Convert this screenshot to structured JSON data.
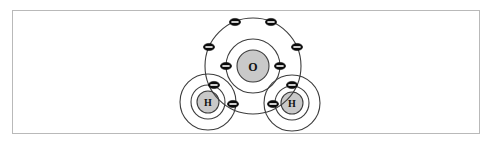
{
  "figure": {
    "molecule_formula": "H2O",
    "background_color": "#ffffff",
    "border_color": "#b9b9b9",
    "shell_color": "#3d3d3d",
    "nucleus_fill": "#c9c9c9",
    "electron_color": "#0b0b0b",
    "electron_sign_color": "#ffffff"
  },
  "atoms": {
    "oxygen": {
      "symbol": "O",
      "cx": 253,
      "cy": 66,
      "nucleus_r": 16,
      "inner_shell_r": 27,
      "outer_shell_r": 48,
      "inner_electron_count": 2,
      "outer_electron_count": 6
    },
    "hydrogen_left": {
      "symbol": "H",
      "cx": 208,
      "cy": 102,
      "nucleus_r": 11,
      "inner_shell_r": 17,
      "outer_shell_r": 28,
      "electron_count": 1
    },
    "hydrogen_right": {
      "symbol": "H",
      "cx": 292,
      "cy": 103,
      "nucleus_r": 11,
      "inner_shell_r": 17,
      "outer_shell_r": 28,
      "electron_count": 1
    }
  },
  "electrons": {
    "symbol": "-",
    "rx": 5.6,
    "ry": 3.6,
    "oxygen_inner": [
      {
        "x": 226,
        "y": 66
      },
      {
        "x": 280,
        "y": 66
      }
    ],
    "oxygen_outer": [
      {
        "x": 235,
        "y": 22
      },
      {
        "x": 271,
        "y": 22
      },
      {
        "x": 209,
        "y": 47
      },
      {
        "x": 297,
        "y": 47
      }
    ],
    "bonding_pair_left": [
      {
        "x": 214,
        "y": 85
      },
      {
        "x": 233,
        "y": 104
      }
    ],
    "bonding_pair_right": [
      {
        "x": 292,
        "y": 85
      },
      {
        "x": 273,
        "y": 104
      }
    ]
  }
}
